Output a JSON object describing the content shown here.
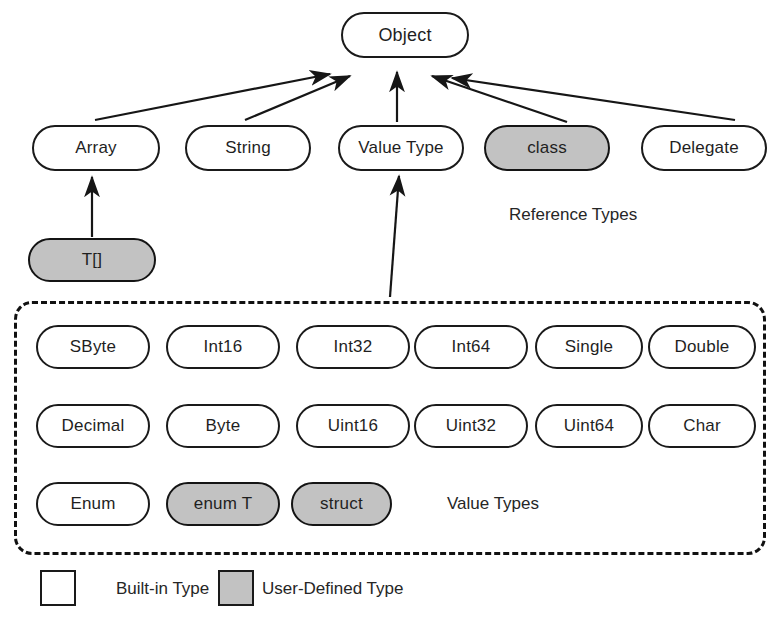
{
  "diagram": {
    "title_node": {
      "label": "Object"
    },
    "reference_types": {
      "group_label": "Reference Types",
      "nodes": [
        {
          "label": "Array",
          "kind": "built-in"
        },
        {
          "label": "String",
          "kind": "built-in"
        },
        {
          "label": "Value Type",
          "kind": "built-in"
        },
        {
          "label": "class",
          "kind": "user-defined"
        },
        {
          "label": "Delegate",
          "kind": "built-in"
        }
      ]
    },
    "array_derived": [
      {
        "label": "T[]",
        "kind": "user-defined"
      }
    ],
    "value_types": {
      "group_label": "Value Types",
      "rows": [
        [
          {
            "label": "SByte",
            "kind": "built-in"
          },
          {
            "label": "Int16",
            "kind": "built-in"
          },
          {
            "label": "Int32",
            "kind": "built-in"
          },
          {
            "label": "Int64",
            "kind": "built-in"
          },
          {
            "label": "Single",
            "kind": "built-in"
          },
          {
            "label": "Double",
            "kind": "built-in"
          }
        ],
        [
          {
            "label": "Decimal",
            "kind": "built-in"
          },
          {
            "label": "Byte",
            "kind": "built-in"
          },
          {
            "label": "Uint16",
            "kind": "built-in"
          },
          {
            "label": "Uint32",
            "kind": "built-in"
          },
          {
            "label": "Uint64",
            "kind": "built-in"
          },
          {
            "label": "Char",
            "kind": "built-in"
          }
        ],
        [
          {
            "label": "Enum",
            "kind": "built-in"
          },
          {
            "label": "enum T",
            "kind": "user-defined"
          },
          {
            "label": "struct",
            "kind": "user-defined"
          }
        ]
      ]
    },
    "legend": {
      "items": [
        {
          "label": "Built-in Type",
          "kind": "built-in"
        },
        {
          "label": "User-Defined Type",
          "kind": "user-defined"
        }
      ]
    },
    "colors": {
      "built_in_fill": "#ffffff",
      "user_defined_fill": "#c2c2c2",
      "stroke": "#1a1a1a",
      "text": "#1f1f1f",
      "background": "#ffffff"
    },
    "edges": [
      {
        "from": "Array",
        "to": "Object"
      },
      {
        "from": "String",
        "to": "Object"
      },
      {
        "from": "Value Type",
        "to": "Object"
      },
      {
        "from": "class",
        "to": "Object"
      },
      {
        "from": "Delegate",
        "to": "Object"
      },
      {
        "from": "T[]",
        "to": "Array"
      },
      {
        "from": "Value Types Group",
        "to": "Value Type"
      }
    ]
  }
}
